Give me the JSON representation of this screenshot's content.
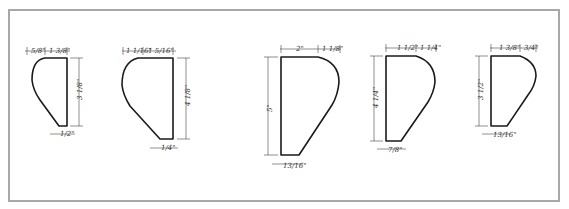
{
  "diagram": {
    "frame_color": "#a8a8a8",
    "line_color": "#1a1a1a",
    "profiles": [
      {
        "id": "profile-1",
        "top_left": "5/8\"",
        "top_right": "1 3/8\"",
        "height": "3 1/8\"",
        "bottom": "1/2\""
      },
      {
        "id": "profile-2",
        "top_left": "1 1/16\"",
        "top_right": "1 5/16\"",
        "height": "4 1/8\"",
        "bottom": "1/4\""
      },
      {
        "id": "profile-3",
        "top_left": "2\"",
        "top_right": "1 1/8\"",
        "height": "5\"",
        "bottom": "13/16\""
      },
      {
        "id": "profile-4",
        "top_left": "1 1/2\"",
        "top_right": "1 1/4\"",
        "height": "4 1/4\"",
        "bottom": "7/8\""
      },
      {
        "id": "profile-5",
        "top_left": "1 3/8\"",
        "top_right": "3/4\"",
        "height": "3 1/2\"",
        "bottom": "13/16\""
      }
    ]
  }
}
